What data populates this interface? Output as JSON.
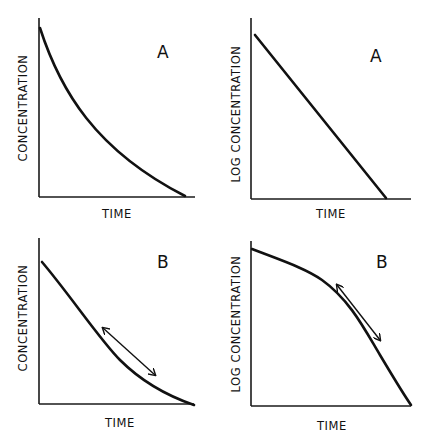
{
  "figure": {
    "panels": [
      {
        "id": "top-left",
        "letter": "A",
        "xlabel": "TIME",
        "ylabel": "CONCENTRATION",
        "curve_type": "exponential decay (concave up)",
        "has_arrow": false
      },
      {
        "id": "top-right",
        "letter": "A",
        "xlabel": "TIME",
        "ylabel": "LOG CONCENTRATION",
        "curve_type": "straight line (linear decline)",
        "has_arrow": false
      },
      {
        "id": "bottom-left",
        "letter": "B",
        "xlabel": "TIME",
        "ylabel": "CONCENTRATION",
        "curve_type": "near-linear decline then curving",
        "has_arrow": true
      },
      {
        "id": "bottom-right",
        "letter": "B",
        "xlabel": "TIME",
        "ylabel": "LOG CONCENTRATION",
        "curve_type": "concave-down decline",
        "has_arrow": true
      }
    ],
    "colors": {
      "ink": "#111111",
      "background": "#ffffff"
    }
  }
}
